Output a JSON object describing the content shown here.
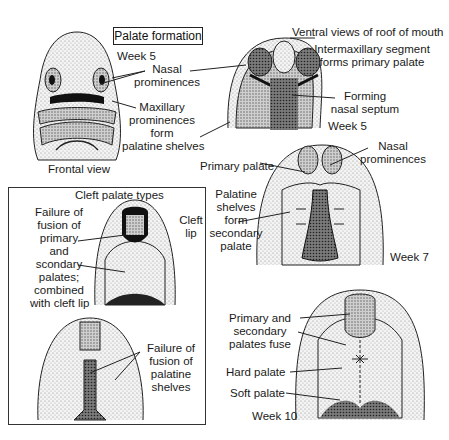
{
  "title": "Palate formation",
  "frontal": {
    "week": "Week 5",
    "view_label": "Frontal view",
    "labels": {
      "nasal_prominences": [
        "Nasal",
        "prominences"
      ],
      "maxillary": [
        "Maxillary",
        "prominences",
        "form",
        "palatine shelves"
      ]
    }
  },
  "ventral": {
    "heading": "Ventral views of roof of mouth",
    "week5": {
      "week": "Week 5",
      "intermaxillary": [
        "Intermaxillary segment",
        "forms primary palate"
      ],
      "septum": [
        "Forming",
        "nasal septum"
      ]
    },
    "week7": {
      "week": "Week 7",
      "nasal_prominences": [
        "Nasal",
        "prominences"
      ],
      "primary_palate": "Primary palate",
      "palatine_shelves": [
        "Palatine",
        "shelves",
        "form",
        "secondary",
        "palate"
      ]
    },
    "week10": {
      "week": "Week 10",
      "fuse": [
        "Primary and",
        "secondary",
        "palates fuse"
      ],
      "hard_palate": "Hard palate",
      "soft_palate": "Soft palate"
    }
  },
  "cleft": {
    "heading": "Cleft palate types",
    "type1": [
      "Failure of",
      "fusion of",
      "primary",
      "and",
      "scondary",
      "palates;",
      "combined",
      "with cleft lip"
    ],
    "cleft_lip": [
      "Cleft",
      "lip"
    ],
    "type2": [
      "Failure of",
      "fusion of",
      "palatine",
      "shelves"
    ]
  },
  "colors": {
    "ink": "#1a1a1a",
    "stipple_light": "#d9d9d9",
    "stipple_mid": "#a8a8a8",
    "stipple_dark": "#5a5a5a"
  }
}
